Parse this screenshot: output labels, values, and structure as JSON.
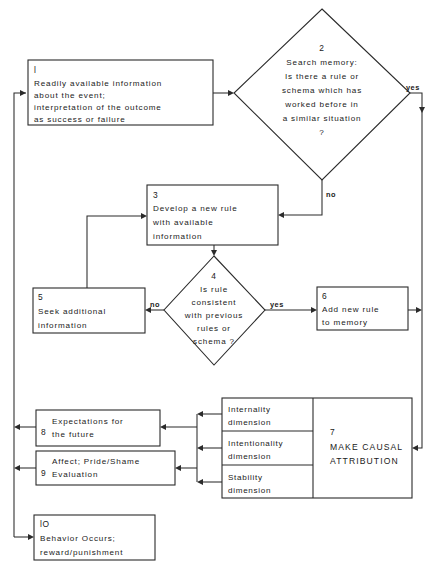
{
  "diagram": {
    "type": "flowchart",
    "canvas": {
      "width": 435,
      "height": 574
    },
    "colors": {
      "stroke": "#2b2b2b",
      "text": "#1a1a1a",
      "background": "#ffffff"
    }
  },
  "nodes": [
    {
      "id": "n1",
      "number": "l",
      "shape": "rect",
      "lines": [
        "Readily available information",
        "about the event;",
        "interpretation of the outcome",
        "as success or failure"
      ]
    },
    {
      "id": "n2",
      "number": "2",
      "shape": "diamond",
      "lines": [
        "Search memory:",
        "Is there a rule or",
        "schema  which has",
        "worked  before  in",
        "a similar situation",
        "?"
      ]
    },
    {
      "id": "n3",
      "number": "3",
      "shape": "rect",
      "lines": [
        "Develop a new rule",
        "with available",
        "information"
      ]
    },
    {
      "id": "n4",
      "number": "4",
      "shape": "diamond",
      "lines": [
        "Is rule",
        "consistent",
        "with  previous",
        "rules or",
        "schema ?"
      ]
    },
    {
      "id": "n5",
      "number": "5",
      "shape": "rect",
      "lines": [
        "Seek additional",
        "information"
      ]
    },
    {
      "id": "n6",
      "number": "6",
      "shape": "rect",
      "lines": [
        "Add new rule",
        "to memory"
      ]
    },
    {
      "id": "n7",
      "number": "7",
      "shape": "rect",
      "lines": [
        "MAKE  CAUSAL",
        "ATTRIBUTION"
      ]
    },
    {
      "id": "n8",
      "number": "8",
      "shape": "rect",
      "lines": [
        "Expectations  for",
        "the   future"
      ]
    },
    {
      "id": "n9",
      "number": "9",
      "shape": "rect",
      "lines": [
        "Affect; Pride/Shame",
        "Evaluation"
      ]
    },
    {
      "id": "n10",
      "number": "lO",
      "shape": "rect",
      "lines": [
        "Behavior  Occurs;",
        "reward/punishment"
      ]
    }
  ],
  "dimensions": [
    {
      "id": "d1",
      "line1": "Internality",
      "line2": "dimension"
    },
    {
      "id": "d2",
      "line1": "Intentionality",
      "line2": "dimension"
    },
    {
      "id": "d3",
      "line1": "Stability",
      "line2": "dimension"
    }
  ],
  "edge_labels": {
    "yes_top": "yes",
    "no_top": "no",
    "no_mid": "no",
    "yes_mid": "yes"
  }
}
